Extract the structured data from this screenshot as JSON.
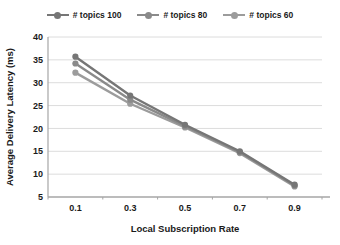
{
  "chart_data": {
    "type": "line",
    "title": "",
    "xlabel": "Local Subscription Rate",
    "ylabel": "Average Delivery Latency (ms)",
    "x_categories": [
      "0.1",
      "0.3",
      "0.5",
      "0.7",
      "0.9"
    ],
    "series": [
      {
        "name": "# topics 100",
        "color": "#767676",
        "marker": "circle",
        "values": [
          35.7,
          27.2,
          20.8,
          15.0,
          7.7
        ]
      },
      {
        "name": "# topics 80",
        "color": "#8a8a8a",
        "marker": "circle",
        "values": [
          34.2,
          26.3,
          20.5,
          14.8,
          7.5
        ]
      },
      {
        "name": "# topics 60",
        "color": "#9c9c9c",
        "marker": "circle",
        "values": [
          32.2,
          25.4,
          20.2,
          14.6,
          7.3
        ]
      }
    ],
    "ylim": [
      5,
      40
    ],
    "ytick_step": 5,
    "yticks": [
      "40",
      "35",
      "30",
      "25",
      "20",
      "15",
      "10",
      "5"
    ],
    "grid": "horizontal",
    "legend_position": "top",
    "colors": {
      "gridline": "#dcdcdc",
      "axis": "#a6a6a6",
      "tick_text": "#1a1a1a",
      "background": "#ffffff"
    }
  }
}
